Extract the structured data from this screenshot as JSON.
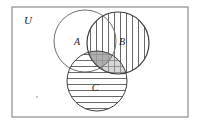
{
  "figure": {
    "kind": "venn-diagram",
    "set_count": 3,
    "background_color": "#ffffff",
    "stroke_color": "#4a4a4a",
    "label_color": "#1a1a1a"
  },
  "universe": {
    "label": "U",
    "label_x": 24,
    "label_y": 24,
    "rect": {
      "x": 12,
      "y": 7,
      "width": 176,
      "height": 110
    },
    "border_color": "#8c8c8c",
    "border_width": 1.2,
    "fill": "#ffffff"
  },
  "circles": [
    {
      "id": "A",
      "label": "A",
      "cx": 85,
      "cy": 41,
      "r": 31,
      "fill_style": "none",
      "label_x": 77,
      "label_y": 45,
      "stroke": "#6e6e6e",
      "stroke_width": 1.0
    },
    {
      "id": "B",
      "label": "B",
      "cx": 118,
      "cy": 43,
      "r": 31,
      "fill_style": "vertical-hatch",
      "label_x": 122,
      "label_y": 45,
      "stroke": "#3c3c3c",
      "stroke_width": 1.2
    },
    {
      "id": "C",
      "label": "C",
      "cx": 97,
      "cy": 81,
      "r": 30,
      "fill_style": "horizontal-hatch",
      "label_x": 95,
      "label_y": 91,
      "stroke": "#3c3c3c",
      "stroke_width": 1.0
    }
  ],
  "hatching": {
    "vertical_spacing": 6,
    "horizontal_spacing": 6,
    "line_color": "#585858",
    "line_width": 0.9
  },
  "shaded_regions": [
    {
      "id": "B-intersect-C",
      "sets": "B ∩ C",
      "fill": "#b4b4b4",
      "opacity": 0.55
    },
    {
      "id": "A-intersect-B-intersect-C",
      "sets": "A ∩ B ∩ C",
      "fill": "#9a9a9a",
      "opacity": 0.65
    }
  ],
  "marks": [
    {
      "id": "stray-dot",
      "x": 37,
      "y": 97,
      "r": 0.9,
      "color": "#b0b0b0"
    }
  ]
}
